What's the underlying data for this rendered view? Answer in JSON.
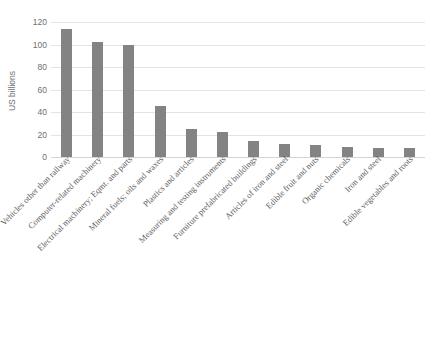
{
  "chart_data": {
    "type": "bar",
    "title": "",
    "xlabel": "",
    "ylabel": "US billions",
    "ylim": [
      0,
      120
    ],
    "ytick_step": 20,
    "yticks": [
      0,
      20,
      40,
      60,
      80,
      100,
      120
    ],
    "grid": true,
    "legend": false,
    "bar_color": "#838383",
    "gridline_color": "#e4e4e4",
    "label_rotation_deg": -45,
    "categories": [
      "Vehicles other than railway",
      "Computer-related machinery",
      "Electrical machinery; Eqmt. and parts",
      "Mineral fuels; oils and waxes",
      "Plastics and articles",
      "Measuring and testing instruments",
      "Furniture prefabricated buildings",
      "Articles of iron and steel",
      "Edible fruit and nuts",
      "Organic chemicals",
      "Iron and steel",
      "Edible vegetables and roots"
    ],
    "values": [
      114,
      102,
      100,
      45,
      25,
      22,
      14,
      12,
      11,
      9,
      8,
      8
    ]
  },
  "axis": {
    "y_title": "US billions",
    "tick_labels": [
      "120",
      "100",
      "80",
      "60",
      "40",
      "20",
      "0"
    ]
  }
}
